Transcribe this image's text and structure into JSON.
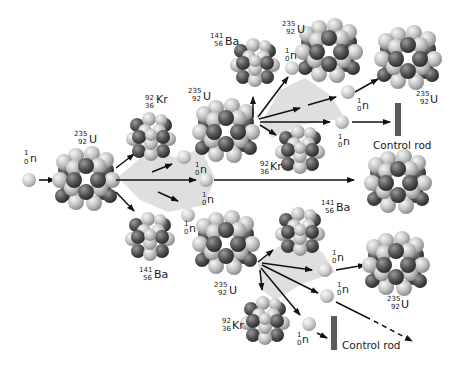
{
  "diagram": {
    "colors": {
      "light_nucleon": "#c8c8c8",
      "dark_nucleon": "#585858",
      "neutron": "#d2d2d2",
      "arrow": "#111111",
      "trail": "#d9d9d9",
      "control_rod": "#5a5a5a"
    },
    "neutron": {
      "symbol": "n",
      "mass": "1",
      "atomic": "0"
    },
    "uranium": {
      "symbol": "U",
      "mass": "235",
      "atomic": "92"
    },
    "krypton": {
      "symbol": "Kr",
      "mass": "92",
      "atomic": "36"
    },
    "barium": {
      "symbol": "Ba",
      "mass": "141",
      "atomic": "56"
    },
    "control_rod_label": "Control rod"
  }
}
